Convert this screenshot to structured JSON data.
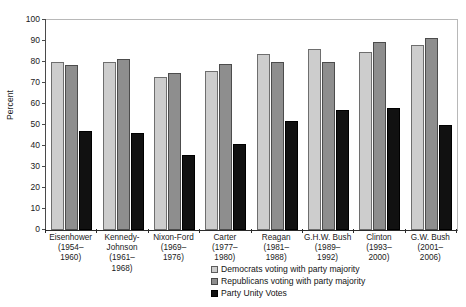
{
  "chart_data": {
    "type": "bar",
    "title": "",
    "xlabel": "",
    "ylabel": "Percent",
    "ylim": [
      0,
      100
    ],
    "yticks": [
      0,
      10,
      20,
      30,
      40,
      50,
      60,
      70,
      80,
      90,
      100
    ],
    "grid": false,
    "legend_position": "bottom-center",
    "categories": [
      "Eisenhower (1954–1960)",
      "Kennedy-Johnson (1961–1968)",
      "Nixon-Ford (1969–1976)",
      "Carter (1977–1980)",
      "Reagan (1981–1988)",
      "G.H.W. Bush (1989–1992)",
      "Clinton (1993–2000)",
      "G.W. Bush (2001–2006)"
    ],
    "category_lines": [
      [
        "Eisenhower",
        "(1954–",
        "1960)"
      ],
      [
        "Kennedy-",
        "Johnson",
        "(1961–",
        "1968)"
      ],
      [
        "Nixon-Ford",
        "(1969–",
        "1976)"
      ],
      [
        "Carter",
        "(1977–",
        "1980)"
      ],
      [
        "Reagan",
        "(1981–",
        "1988)"
      ],
      [
        "G.H.W. Bush",
        "(1989–",
        "1992)"
      ],
      [
        "Clinton",
        "(1993–",
        "2000)"
      ],
      [
        "G.W. Bush",
        "(2001–",
        "2006)"
      ]
    ],
    "series": [
      {
        "name": "Democrats voting with party majority",
        "color": "#cdcdcd",
        "values": [
          80,
          80,
          73,
          75.5,
          84,
          86,
          85,
          88
        ]
      },
      {
        "name": "Republicans voting with party majority",
        "color": "#8e8e8e",
        "values": [
          78.5,
          81.5,
          75,
          79,
          80,
          80,
          89.5,
          91.5
        ]
      },
      {
        "name": "Party Unity Votes",
        "color": "#111111",
        "values": [
          47,
          46,
          35.5,
          41,
          52,
          57,
          58,
          50
        ]
      }
    ]
  }
}
